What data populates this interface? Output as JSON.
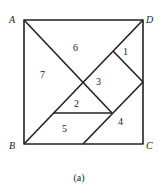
{
  "diagram": {
    "caption": "(a)",
    "vertices": {
      "A": "A",
      "B": "B",
      "C": "C",
      "D": "D"
    },
    "pieces": [
      "1",
      "2",
      "3",
      "4",
      "5",
      "6",
      "7"
    ],
    "stroke_color": "#222222"
  }
}
